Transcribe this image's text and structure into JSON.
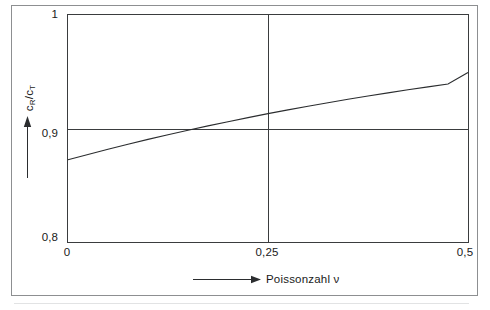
{
  "figure": {
    "background_color": "#ffffff",
    "frame_color": "#8d8f91",
    "axis_color": "#3a3c3e",
    "curve_color": "#2b2d2f"
  },
  "axis_labels": {
    "y_prefix": "c",
    "y_sub_1": "R",
    "y_mid": "/c",
    "y_sub_2": "T",
    "y_full": "cR/cT",
    "x_text": "Poissonzahl ν"
  },
  "ticks": {
    "y": [
      "1",
      "0,9",
      "0,8"
    ],
    "x": [
      "0",
      "0,25",
      "0,5"
    ]
  },
  "chart_data": {
    "type": "line",
    "title": "",
    "subtitle": "",
    "xlabel": "Poissonzahl ν",
    "ylabel": "cR/cT",
    "xlim": [
      0,
      0.5
    ],
    "ylim": [
      0.8,
      1.0
    ],
    "xticks": [
      0,
      0.25,
      0.5
    ],
    "xticklabels": [
      "0",
      "0,25",
      "0,5"
    ],
    "yticks": [
      0.8,
      0.9,
      1.0
    ],
    "yticklabels": [
      "0,8",
      "0,9",
      "1"
    ],
    "grid": true,
    "grid_lines": {
      "horizontal": [
        0.9
      ],
      "vertical": [
        0.25
      ]
    },
    "legend": null,
    "annotations": [],
    "series": [
      {
        "name": "cR/cT",
        "x": [
          0.0,
          0.025,
          0.05,
          0.075,
          0.1,
          0.125,
          0.15,
          0.175,
          0.2,
          0.225,
          0.25,
          0.275,
          0.3,
          0.325,
          0.35,
          0.375,
          0.4,
          0.425,
          0.45,
          0.475,
          0.5
        ],
        "y": [
          0.8724,
          0.8771,
          0.8817,
          0.8861,
          0.8904,
          0.8945,
          0.8985,
          0.9023,
          0.906,
          0.9096,
          0.9131,
          0.9164,
          0.9196,
          0.9227,
          0.9257,
          0.9286,
          0.9314,
          0.9341,
          0.9367,
          0.9392,
          0.9493
        ]
      }
    ]
  }
}
